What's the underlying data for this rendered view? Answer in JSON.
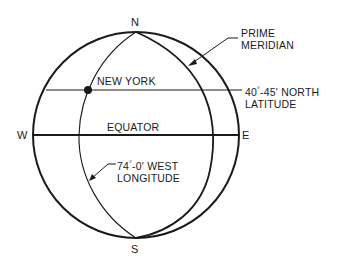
{
  "diagram": {
    "type": "globe-coordinates",
    "compass": {
      "north": "N",
      "south": "S",
      "west": "W",
      "east": "E"
    },
    "labels": {
      "prime_meridian_line1": "PRIME",
      "prime_meridian_line2": "MERIDIAN",
      "new_york": "NEW YORK",
      "latitude_deg": "40",
      "latitude_rest": "-45' NORTH",
      "latitude_line2": "LATITUDE",
      "equator": "EQUATOR",
      "longitude_deg": "74",
      "longitude_rest": "-0' WEST",
      "longitude_line2": "LONGITUDE",
      "degree_symbol": "°"
    },
    "points": [
      {
        "name": "New York",
        "latitude": "40°-45' N",
        "longitude": "74°-0' W"
      }
    ],
    "colors": {
      "stroke": "#1a1a1a",
      "background": "#ffffff"
    }
  }
}
